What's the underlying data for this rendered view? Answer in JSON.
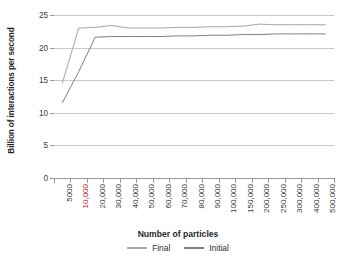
{
  "chart_data": {
    "type": "line",
    "title": "",
    "xlabel": "Number of particles",
    "ylabel": "Billion of interactions per second",
    "categories": [
      "5000",
      "10,000",
      "20,000",
      "30,000",
      "40,000",
      "50,000",
      "60,000",
      "70,000",
      "80,000",
      "90,000",
      "100,000",
      "150,000",
      "200,000",
      "250,000",
      "300,000",
      "400,000",
      "500,000"
    ],
    "highlighted_category": "10,000",
    "highlight_color": "#c0202a",
    "ylim": [
      0,
      25
    ],
    "yticks": [
      0,
      5,
      10,
      15,
      20,
      25
    ],
    "grid": true,
    "legend_position": "bottom",
    "series": [
      {
        "name": "Final",
        "color": "#a6a6a6",
        "values": [
          14.5,
          23.0,
          23.1,
          23.4,
          23.0,
          23.0,
          23.0,
          23.1,
          23.1,
          23.2,
          23.2,
          23.3,
          23.6,
          23.5,
          23.5,
          23.5,
          23.5
        ]
      },
      {
        "name": "Initial",
        "color": "#808080",
        "values": [
          11.5,
          16.3,
          21.6,
          21.7,
          21.7,
          21.7,
          21.7,
          21.8,
          21.8,
          21.9,
          21.9,
          22.0,
          22.0,
          22.1,
          22.1,
          22.1,
          22.1
        ]
      }
    ]
  },
  "legend": {
    "entries": [
      {
        "label": "Final"
      },
      {
        "label": "Initial"
      }
    ]
  },
  "axis": {
    "y_title": "Billion of interactions per second",
    "x_title": "Number of particles"
  }
}
